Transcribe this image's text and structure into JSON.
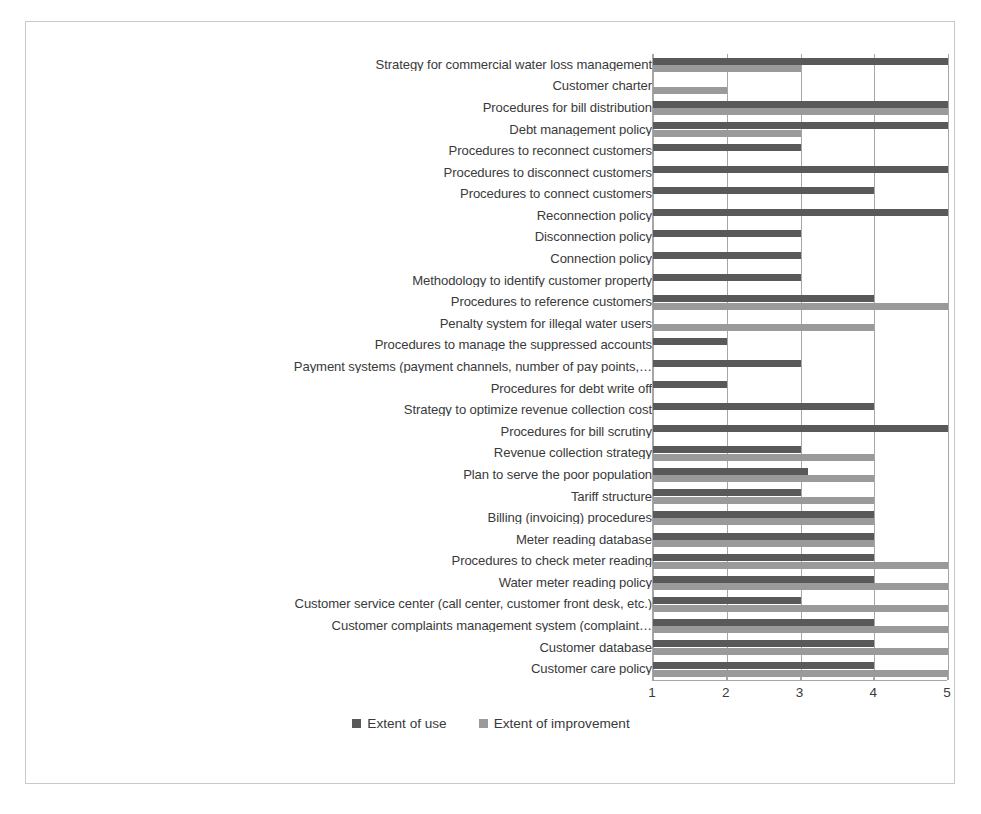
{
  "chart_data": {
    "type": "bar",
    "orientation": "horizontal",
    "title": "",
    "xlabel": "",
    "ylabel": "",
    "xlim": [
      1,
      5
    ],
    "xticks": [
      "1",
      "2",
      "3",
      "4",
      "5"
    ],
    "grid": true,
    "legend_position": "bottom-center",
    "series": [
      {
        "name": "Extent of use",
        "color": "#595959"
      },
      {
        "name": "Extent of improvement",
        "color": "#9a9a9a"
      }
    ],
    "categories": [
      "Strategy for commercial water loss management",
      "Customer charter",
      "Procedures for bill distribution",
      "Debt management policy",
      "Procedures to reconnect customers",
      "Procedures to disconnect customers",
      "Procedures to connect customers",
      "Reconnection policy",
      "Disconnection policy",
      "Connection policy",
      "Methodology to identify customer property",
      "Procedures to reference customers",
      "Penalty system  for illegal water users",
      "Procedures to manage the suppressed accounts",
      "Payment systems (payment channels, number of pay points,…",
      "Procedures for debt write off",
      "Strategy to optimize revenue collection cost",
      "Procedures for bill scrutiny",
      "Revenue collection strategy",
      "Plan to serve the poor population",
      "Tariff structure",
      "Billing (invoicing) procedures",
      "Meter reading database",
      "Procedures to check meter reading",
      "Water meter reading policy",
      "Customer service center (call center, customer front desk, etc.)",
      "Customer complaints management system (complaint…",
      "Customer database",
      "Customer care policy"
    ],
    "values_extent_of_use": [
      5,
      1,
      5,
      5,
      3,
      5,
      4,
      5,
      3,
      3,
      3,
      4,
      1,
      2,
      3,
      2,
      4,
      5,
      3,
      3.1,
      3,
      4,
      4,
      4,
      4,
      3,
      4,
      4,
      4
    ],
    "values_extent_of_improvement": [
      3,
      2,
      5,
      3,
      1,
      1,
      1,
      1,
      1,
      1,
      1,
      5,
      4,
      1,
      1,
      1,
      1,
      1,
      4,
      4,
      4,
      4,
      4,
      5,
      5,
      5,
      5,
      5,
      5
    ]
  },
  "legend": {
    "items": [
      {
        "label": "Extent of use",
        "color": "#595959"
      },
      {
        "label": "Extent of improvement",
        "color": "#9a9a9a"
      }
    ]
  },
  "axis": {
    "ticks": [
      "1",
      "2",
      "3",
      "4",
      "5"
    ]
  }
}
